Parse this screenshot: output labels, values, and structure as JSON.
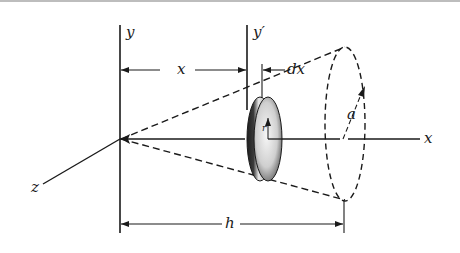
{
  "figure": {
    "colors": {
      "ink": "#1a1a1a",
      "disk_dark": "#2a2a2a",
      "disk_light": "#f2f2f2",
      "top_rule": "#bdbdbd"
    },
    "labels": {
      "y_axis": "y",
      "y_prime_axis": "y′",
      "x_dimension": "x",
      "dx_dimension": "dx",
      "radius_r": "r",
      "radius_a": "a",
      "x_axis": "x",
      "z_axis": "z",
      "h_dimension": "h"
    }
  }
}
